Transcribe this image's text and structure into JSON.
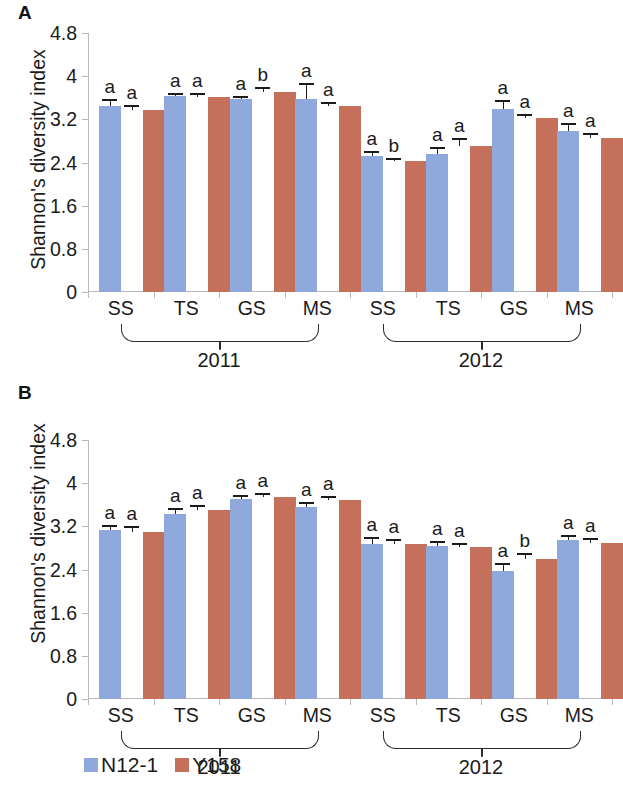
{
  "figure": {
    "panels": [
      {
        "letter": "A",
        "ylabel": "Shannon's diversity index"
      },
      {
        "letter": "B",
        "ylabel": "Shannon's diversity index"
      }
    ],
    "legend": [
      {
        "label": "N12-1",
        "color": "#8fa9dc"
      },
      {
        "label": "Y158",
        "color": "#c4705a"
      }
    ],
    "year_groups": [
      {
        "label": "2011"
      },
      {
        "label": "2012"
      }
    ]
  },
  "chart_data": [
    {
      "panel": "A",
      "type": "bar",
      "title": "A",
      "xlabel": "",
      "ylabel": "Shannon's diversity index",
      "ylim": [
        0,
        4.8
      ],
      "yticks": [
        "0",
        "0.8",
        "1.6",
        "2.4",
        "3.2",
        "4",
        "4.8"
      ],
      "ytick_values": [
        0,
        0.8,
        1.6,
        2.4,
        3.2,
        4,
        4.8
      ],
      "grid": false,
      "legend_position": "bottom",
      "groups": [
        "2011",
        "2012"
      ],
      "categories": [
        "SS",
        "TS",
        "GS",
        "MS",
        "SS",
        "TS",
        "GS",
        "MS"
      ],
      "category_years": [
        "2011",
        "2011",
        "2011",
        "2011",
        "2012",
        "2012",
        "2012",
        "2012"
      ],
      "series": [
        {
          "name": "N12-1",
          "color": "#8fa9dc",
          "values": [
            3.45,
            3.63,
            3.58,
            3.58,
            2.53,
            2.55,
            3.4,
            2.98
          ],
          "errors": [
            0.09,
            0.03,
            0.02,
            0.25,
            0.04,
            0.1,
            0.12,
            0.11
          ],
          "sig": [
            "a",
            "a",
            "a",
            "a",
            "a",
            "a",
            "a",
            "a"
          ]
        },
        {
          "name": "Y158",
          "color": "#c4705a",
          "values": [
            3.37,
            3.62,
            3.7,
            3.45,
            2.42,
            2.7,
            3.23,
            2.86
          ],
          "errors": [
            0.05,
            0.03,
            0.06,
            0.04,
            0.02,
            0.11,
            0.04,
            0.05
          ],
          "sig": [
            "a",
            "a",
            "b",
            "a",
            "b",
            "a",
            "a",
            "a"
          ]
        }
      ]
    },
    {
      "panel": "B",
      "type": "bar",
      "title": "B",
      "xlabel": "",
      "ylabel": "Shannon's diversity index",
      "ylim": [
        0,
        4.8
      ],
      "yticks": [
        "0",
        "0.8",
        "1.6",
        "2.4",
        "3.2",
        "4",
        "4.8"
      ],
      "ytick_values": [
        0,
        0.8,
        1.6,
        2.4,
        3.2,
        4,
        4.8
      ],
      "grid": false,
      "legend_position": "bottom",
      "groups": [
        "2011",
        "2012"
      ],
      "categories": [
        "SS",
        "TS",
        "GS",
        "MS",
        "SS",
        "TS",
        "GS",
        "MS"
      ],
      "category_years": [
        "2011",
        "2011",
        "2011",
        "2011",
        "2012",
        "2012",
        "2012",
        "2012"
      ],
      "series": [
        {
          "name": "N12-1",
          "color": "#8fa9dc",
          "values": [
            3.13,
            3.43,
            3.7,
            3.55,
            2.87,
            2.83,
            2.37,
            2.95
          ],
          "errors": [
            0.05,
            0.07,
            0.05,
            0.07,
            0.09,
            0.06,
            0.11,
            0.05
          ],
          "sig": [
            "a",
            "a",
            "a",
            "a",
            "a",
            "a",
            "a",
            "a"
          ]
        },
        {
          "name": "Y158",
          "color": "#c4705a",
          "values": [
            3.1,
            3.5,
            3.75,
            3.68,
            2.87,
            2.82,
            2.6,
            2.9
          ],
          "errors": [
            0.07,
            0.05,
            0.04,
            0.05,
            0.06,
            0.04,
            0.06,
            0.05
          ],
          "sig": [
            "a",
            "a",
            "a",
            "a",
            "a",
            "a",
            "b",
            "a"
          ]
        }
      ]
    }
  ]
}
